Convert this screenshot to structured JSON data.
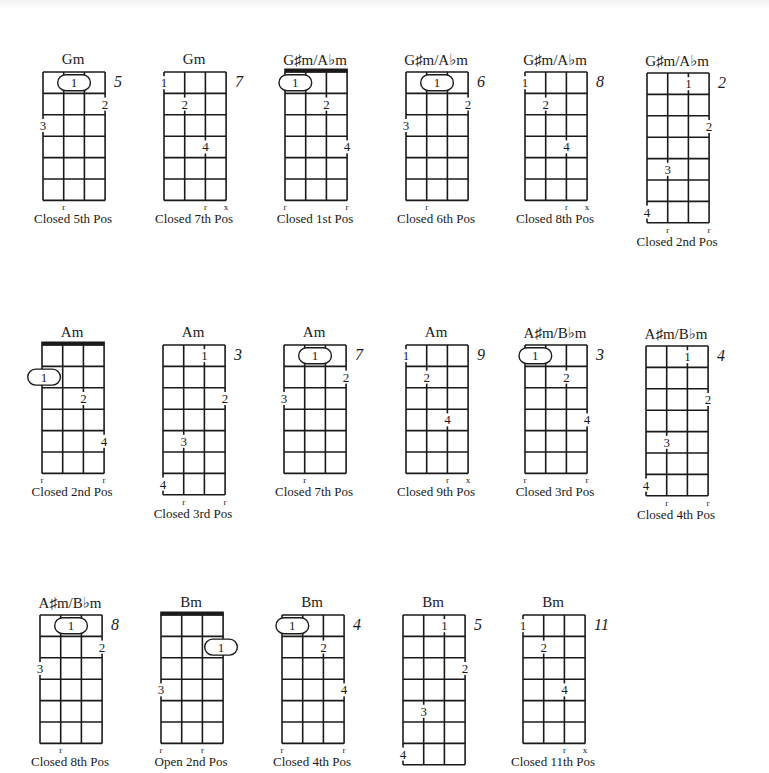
{
  "colors": {
    "ink": "#1a1a1a",
    "background": "#ffffff"
  },
  "cell": {
    "w": 20.7,
    "h": 21.4
  },
  "chords": [
    {
      "name": "Gm",
      "position_label": "Closed 5th Pos",
      "start_fret_label": "5",
      "x": 42,
      "y": 71,
      "frets": 6,
      "nut": false,
      "barre": {
        "fret": 1,
        "from": 1,
        "to": 2,
        "finger": "1"
      },
      "fingers": [
        {
          "string": 3,
          "fret": 2,
          "finger": "2"
        },
        {
          "string": 0,
          "fret": 3,
          "finger": "3"
        }
      ],
      "bottom_marks": [
        {
          "string": 1,
          "mark": "r"
        }
      ]
    },
    {
      "name": "Gm",
      "position_label": "Closed 7th Pos",
      "start_fret_label": "7",
      "x": 163,
      "y": 71,
      "frets": 6,
      "nut": false,
      "fingers": [
        {
          "string": 0,
          "fret": 1,
          "finger": "1"
        },
        {
          "string": 1,
          "fret": 2,
          "finger": "2"
        },
        {
          "string": 2,
          "fret": 4,
          "finger": "4"
        }
      ],
      "bottom_marks": [
        {
          "string": 2,
          "mark": "r"
        },
        {
          "string": 3,
          "mark": "x"
        }
      ]
    },
    {
      "name": "G♯m/A♭m",
      "position_label": "Closed 1st Pos",
      "start_fret_label": "",
      "x": 284,
      "y": 71,
      "frets": 6,
      "nut": true,
      "barre": {
        "fret": 1,
        "from": 0,
        "to": 1,
        "finger": "1"
      },
      "fingers": [
        {
          "string": 2,
          "fret": 2,
          "finger": "2"
        },
        {
          "string": 3,
          "fret": 4,
          "finger": "4"
        }
      ],
      "bottom_marks": [
        {
          "string": 0,
          "mark": "r"
        },
        {
          "string": 3,
          "mark": "r"
        }
      ]
    },
    {
      "name": "G♯m/A♭m",
      "position_label": "Closed 6th Pos",
      "start_fret_label": "6",
      "x": 405,
      "y": 71,
      "frets": 6,
      "nut": false,
      "barre": {
        "fret": 1,
        "from": 1,
        "to": 2,
        "finger": "1"
      },
      "fingers": [
        {
          "string": 3,
          "fret": 2,
          "finger": "2"
        },
        {
          "string": 0,
          "fret": 3,
          "finger": "3"
        }
      ],
      "bottom_marks": [
        {
          "string": 1,
          "mark": "r"
        }
      ]
    },
    {
      "name": "G♯m/A♭m",
      "position_label": "Closed 8th Pos",
      "start_fret_label": "8",
      "x": 524,
      "y": 71,
      "frets": 6,
      "nut": false,
      "fingers": [
        {
          "string": 0,
          "fret": 1,
          "finger": "1"
        },
        {
          "string": 1,
          "fret": 2,
          "finger": "2"
        },
        {
          "string": 2,
          "fret": 4,
          "finger": "4"
        }
      ],
      "bottom_marks": [
        {
          "string": 2,
          "mark": "r"
        },
        {
          "string": 3,
          "mark": "x"
        }
      ]
    },
    {
      "name": "G♯m/A♭m",
      "position_label": "Closed 2nd Pos",
      "start_fret_label": "2",
      "x": 646,
      "y": 72,
      "frets": 7,
      "nut": false,
      "fingers": [
        {
          "string": 2,
          "fret": 1,
          "finger": "1"
        },
        {
          "string": 3,
          "fret": 3,
          "finger": "2"
        },
        {
          "string": 1,
          "fret": 5,
          "finger": "3"
        },
        {
          "string": 0,
          "fret": 7,
          "finger": "4"
        }
      ],
      "bottom_marks": [
        {
          "string": 1,
          "mark": "r"
        },
        {
          "string": 3,
          "mark": "r"
        }
      ]
    },
    {
      "name": "Am",
      "position_label": "Closed 2nd Pos",
      "start_fret_label": "",
      "x": 41,
      "y": 344,
      "frets": 6,
      "nut": true,
      "barre": {
        "fret": 2,
        "from": 0,
        "to": 1,
        "finger": "1",
        "offset": -1
      },
      "fingers": [
        {
          "string": 2,
          "fret": 3,
          "finger": "2"
        },
        {
          "string": 3,
          "fret": 5,
          "finger": "4"
        }
      ],
      "bottom_marks": [
        {
          "string": 0,
          "mark": "r"
        },
        {
          "string": 3,
          "mark": "r"
        }
      ]
    },
    {
      "name": "Am",
      "position_label": "Closed 3rd Pos",
      "start_fret_label": "3",
      "x": 162,
      "y": 344,
      "frets": 7,
      "nut": false,
      "fingers": [
        {
          "string": 2,
          "fret": 1,
          "finger": "1"
        },
        {
          "string": 3,
          "fret": 3,
          "finger": "2"
        },
        {
          "string": 1,
          "fret": 5,
          "finger": "3"
        },
        {
          "string": 0,
          "fret": 7,
          "finger": "4"
        }
      ],
      "bottom_marks": [
        {
          "string": 1,
          "mark": "r"
        },
        {
          "string": 3,
          "mark": "r"
        }
      ]
    },
    {
      "name": "Am",
      "position_label": "Closed 7th Pos",
      "start_fret_label": "7",
      "x": 283,
      "y": 344,
      "frets": 6,
      "nut": false,
      "barre": {
        "fret": 1,
        "from": 1,
        "to": 2,
        "finger": "1"
      },
      "fingers": [
        {
          "string": 3,
          "fret": 2,
          "finger": "2"
        },
        {
          "string": 0,
          "fret": 3,
          "finger": "3"
        }
      ],
      "bottom_marks": [
        {
          "string": 1,
          "mark": "r"
        }
      ]
    },
    {
      "name": "Am",
      "position_label": "Closed 9th Pos",
      "start_fret_label": "9",
      "x": 405,
      "y": 344,
      "frets": 6,
      "nut": false,
      "fingers": [
        {
          "string": 0,
          "fret": 1,
          "finger": "1"
        },
        {
          "string": 1,
          "fret": 2,
          "finger": "2"
        },
        {
          "string": 2,
          "fret": 4,
          "finger": "4"
        }
      ],
      "bottom_marks": [
        {
          "string": 2,
          "mark": "r"
        },
        {
          "string": 3,
          "mark": "x"
        }
      ]
    },
    {
      "name": "A♯m/B♭m",
      "position_label": "Closed 3rd Pos",
      "start_fret_label": "3",
      "x": 524,
      "y": 344,
      "frets": 6,
      "nut": false,
      "barre": {
        "fret": 1,
        "from": 0,
        "to": 1,
        "finger": "1"
      },
      "fingers": [
        {
          "string": 2,
          "fret": 2,
          "finger": "2"
        },
        {
          "string": 3,
          "fret": 4,
          "finger": "4"
        }
      ],
      "bottom_marks": [
        {
          "string": 0,
          "mark": "r"
        },
        {
          "string": 3,
          "mark": "r"
        }
      ]
    },
    {
      "name": "A♯m/B♭m",
      "position_label": "Closed 4th Pos",
      "start_fret_label": "4",
      "x": 645,
      "y": 345,
      "frets": 7,
      "nut": false,
      "fingers": [
        {
          "string": 2,
          "fret": 1,
          "finger": "1"
        },
        {
          "string": 3,
          "fret": 3,
          "finger": "2"
        },
        {
          "string": 1,
          "fret": 5,
          "finger": "3"
        },
        {
          "string": 0,
          "fret": 7,
          "finger": "4"
        }
      ],
      "bottom_marks": [
        {
          "string": 1,
          "mark": "r"
        },
        {
          "string": 3,
          "mark": "r"
        }
      ]
    },
    {
      "name": "A♯m/B♭m",
      "position_label": "Closed 8th Pos",
      "start_fret_label": "8",
      "x": 39,
      "y": 614,
      "frets": 6,
      "nut": false,
      "barre": {
        "fret": 1,
        "from": 1,
        "to": 2,
        "finger": "1"
      },
      "fingers": [
        {
          "string": 3,
          "fret": 2,
          "finger": "2"
        },
        {
          "string": 0,
          "fret": 3,
          "finger": "3"
        }
      ],
      "bottom_marks": [
        {
          "string": 1,
          "mark": "r"
        }
      ]
    },
    {
      "name": "Bm",
      "position_label": "Open 2nd Pos",
      "start_fret_label": "",
      "x": 160,
      "y": 614,
      "frets": 6,
      "nut": true,
      "barre": {
        "fret": 2,
        "from": 2,
        "to": 3,
        "finger": "1",
        "offset": 1
      },
      "fingers": [
        {
          "string": 0,
          "fret": 4,
          "finger": "3"
        }
      ],
      "bottom_marks": [
        {
          "string": 0,
          "mark": "r"
        },
        {
          "string": 2,
          "mark": "r"
        }
      ]
    },
    {
      "name": "Bm",
      "position_label": "Closed 4th Pos",
      "start_fret_label": "4",
      "x": 281,
      "y": 614,
      "frets": 6,
      "nut": false,
      "barre": {
        "fret": 1,
        "from": 0,
        "to": 1,
        "finger": "1"
      },
      "fingers": [
        {
          "string": 2,
          "fret": 2,
          "finger": "2"
        },
        {
          "string": 3,
          "fret": 4,
          "finger": "4"
        }
      ],
      "bottom_marks": [
        {
          "string": 0,
          "mark": "r"
        },
        {
          "string": 3,
          "mark": "r"
        }
      ]
    },
    {
      "name": "Bm",
      "position_label": "",
      "start_fret_label": "5",
      "x": 402,
      "y": 614,
      "frets": 7,
      "nut": false,
      "fingers": [
        {
          "string": 2,
          "fret": 1,
          "finger": "1"
        },
        {
          "string": 3,
          "fret": 3,
          "finger": "2"
        },
        {
          "string": 1,
          "fret": 5,
          "finger": "3"
        },
        {
          "string": 0,
          "fret": 7,
          "finger": "4"
        }
      ],
      "bottom_marks": []
    },
    {
      "name": "Bm",
      "position_label": "Closed 11th Pos",
      "start_fret_label": "11",
      "x": 522,
      "y": 614,
      "frets": 6,
      "nut": false,
      "fingers": [
        {
          "string": 0,
          "fret": 1,
          "finger": "1"
        },
        {
          "string": 1,
          "fret": 2,
          "finger": "2"
        },
        {
          "string": 2,
          "fret": 4,
          "finger": "4"
        }
      ],
      "bottom_marks": [
        {
          "string": 2,
          "mark": "r"
        },
        {
          "string": 3,
          "mark": "x"
        }
      ]
    }
  ]
}
